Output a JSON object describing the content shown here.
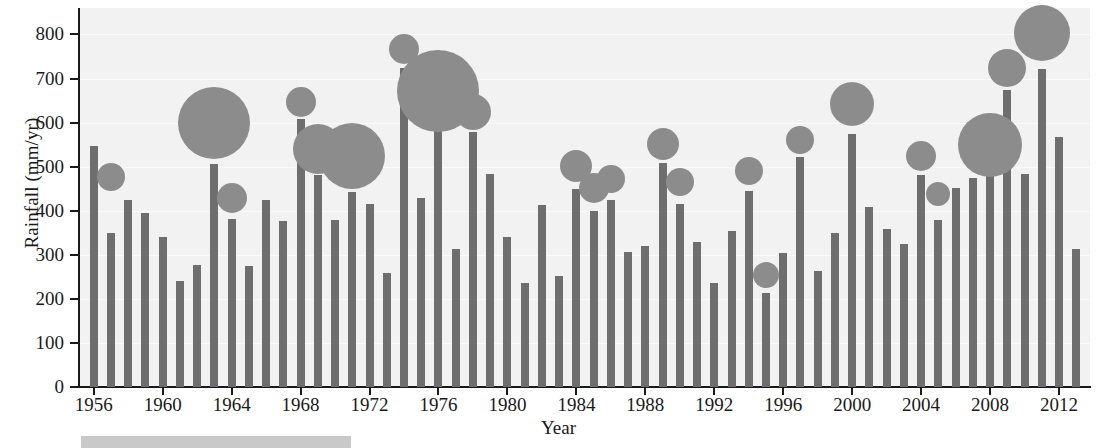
{
  "chart_data": {
    "type": "bar",
    "title": "",
    "subtitle": "",
    "xlabel": "Year",
    "ylabel": "Rainfall (mm/yr)",
    "xlim": [
      1955.2,
      2013.8
    ],
    "ylim": [
      0,
      860
    ],
    "ytick_values": [
      0,
      100,
      200,
      300,
      400,
      500,
      600,
      700,
      800
    ],
    "ytick_labels": [
      "0",
      "100",
      "200",
      "300",
      "400",
      "500",
      "600",
      "700",
      "800"
    ],
    "xtick_values": [
      1956,
      1960,
      1964,
      1968,
      1972,
      1976,
      1980,
      1984,
      1988,
      1992,
      1996,
      2000,
      2004,
      2008,
      2012
    ],
    "xtick_labels": [
      "1956",
      "1960",
      "1964",
      "1968",
      "1972",
      "1976",
      "1980",
      "1984",
      "1988",
      "1992",
      "1996",
      "2000",
      "2004",
      "2008",
      "2012"
    ],
    "grid": true,
    "legend": "none",
    "plot_background": "#f2f2f2",
    "bar_color": "#6e6e6e",
    "bubble_color": "#8c8c8c",
    "categories": [
      1956,
      1957,
      1958,
      1959,
      1960,
      1961,
      1962,
      1963,
      1964,
      1965,
      1966,
      1967,
      1968,
      1969,
      1970,
      1971,
      1972,
      1973,
      1974,
      1975,
      1976,
      1977,
      1978,
      1979,
      1980,
      1981,
      1982,
      1983,
      1984,
      1985,
      1986,
      1987,
      1988,
      1989,
      1990,
      1991,
      1992,
      1993,
      1994,
      1995,
      1996,
      1997,
      1998,
      1999,
      2000,
      2001,
      2002,
      2003,
      2004,
      2005,
      2006,
      2007,
      2008,
      2009,
      2010,
      2011,
      2012,
      2013
    ],
    "values": [
      547,
      350,
      425,
      394,
      341,
      240,
      277,
      507,
      381,
      274,
      424,
      377,
      608,
      482,
      378,
      443,
      416,
      258,
      724,
      429,
      592,
      314,
      578,
      484,
      341,
      235,
      414,
      253,
      449,
      400,
      424,
      306,
      321,
      509,
      415,
      328,
      236,
      353,
      445,
      214,
      305,
      521,
      263,
      349,
      575,
      409,
      359,
      325,
      480,
      379,
      451,
      474,
      549,
      673,
      484,
      722,
      568,
      314
    ],
    "series": [
      {
        "name": "Annual rainfall",
        "type": "bar",
        "values": [
          547,
          350,
          425,
          394,
          341,
          240,
          277,
          507,
          381,
          274,
          424,
          377,
          608,
          482,
          378,
          443,
          416,
          258,
          724,
          429,
          592,
          314,
          578,
          484,
          341,
          235,
          414,
          253,
          449,
          400,
          424,
          306,
          321,
          509,
          415,
          328,
          236,
          353,
          445,
          214,
          305,
          521,
          263,
          349,
          575,
          409,
          359,
          325,
          480,
          379,
          451,
          474,
          549,
          673,
          484,
          722,
          568,
          314
        ]
      },
      {
        "name": "Event magnitude bubbles",
        "type": "scatter",
        "points": [
          {
            "year": 1957,
            "value": 476,
            "size": 14
          },
          {
            "year": 1963,
            "value": 598,
            "size": 36
          },
          {
            "year": 1964,
            "value": 428,
            "size": 15
          },
          {
            "year": 1968,
            "value": 646,
            "size": 15
          },
          {
            "year": 1969,
            "value": 541,
            "size": 25
          },
          {
            "year": 1971,
            "value": 525,
            "size": 33
          },
          {
            "year": 1974,
            "value": 768,
            "size": 15
          },
          {
            "year": 1976,
            "value": 672,
            "size": 41
          },
          {
            "year": 1978,
            "value": 624,
            "size": 18
          },
          {
            "year": 1984,
            "value": 502,
            "size": 16
          },
          {
            "year": 1985,
            "value": 451,
            "size": 15
          },
          {
            "year": 1986,
            "value": 472,
            "size": 14
          },
          {
            "year": 1989,
            "value": 551,
            "size": 16
          },
          {
            "year": 1990,
            "value": 466,
            "size": 14
          },
          {
            "year": 1994,
            "value": 490,
            "size": 14
          },
          {
            "year": 1995,
            "value": 254,
            "size": 13
          },
          {
            "year": 1997,
            "value": 561,
            "size": 14
          },
          {
            "year": 2000,
            "value": 643,
            "size": 22
          },
          {
            "year": 2004,
            "value": 525,
            "size": 15
          },
          {
            "year": 2005,
            "value": 437,
            "size": 12
          },
          {
            "year": 2008,
            "value": 549,
            "size": 32
          },
          {
            "year": 2009,
            "value": 724,
            "size": 19
          },
          {
            "year": 2011,
            "value": 803,
            "size": 28
          }
        ]
      }
    ]
  },
  "footer": {
    "swatch_label": "",
    "swatch_color": "#c9c9c9"
  }
}
